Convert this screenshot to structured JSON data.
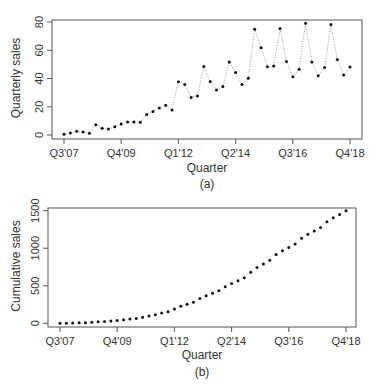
{
  "chart_data": [
    {
      "type": "line",
      "panel_label": "(a)",
      "title": "",
      "xlabel": "Quarter",
      "ylabel": "Quarterly sales",
      "ylim": [
        0,
        80
      ],
      "yticks": [
        0,
        20,
        40,
        60,
        80
      ],
      "xtick_labels": [
        "Q3'07",
        "Q4'09",
        "Q1'12",
        "Q2'14",
        "Q3'16",
        "Q4'18"
      ],
      "xtick_positions": [
        0,
        9,
        18,
        27,
        36,
        45
      ],
      "grid": false,
      "legend": null,
      "style": "points joined by dotted line",
      "x": [
        "Q3'07",
        "Q4'07",
        "Q1'08",
        "Q2'08",
        "Q3'08",
        "Q4'08",
        "Q1'09",
        "Q2'09",
        "Q3'09",
        "Q4'09",
        "Q1'10",
        "Q2'10",
        "Q3'10",
        "Q4'10",
        "Q1'11",
        "Q2'11",
        "Q3'11",
        "Q4'11",
        "Q1'12",
        "Q2'12",
        "Q3'12",
        "Q4'12",
        "Q1'13",
        "Q2'13",
        "Q3'13",
        "Q4'13",
        "Q1'14",
        "Q2'14",
        "Q3'14",
        "Q4'14",
        "Q1'15",
        "Q2'15",
        "Q3'15",
        "Q4'15",
        "Q1'16",
        "Q2'16",
        "Q3'16",
        "Q4'16",
        "Q1'17",
        "Q2'17",
        "Q3'17",
        "Q4'17",
        "Q1'18",
        "Q2'18",
        "Q3'18",
        "Q4'18"
      ],
      "series": [
        {
          "name": "Quarterly sales",
          "values": [
            0.5,
            1.4,
            2.6,
            2.1,
            1.2,
            7.3,
            4.7,
            4.2,
            5.9,
            7.8,
            9.2,
            9.2,
            9.0,
            14.6,
            16.7,
            19.1,
            21.0,
            17.7,
            37.7,
            35.8,
            26.6,
            27.6,
            48.5,
            37.9,
            31.8,
            34.4,
            51.6,
            44.3,
            35.8,
            40.1,
            74.9,
            61.7,
            48.3,
            48.8,
            75.4,
            52.1,
            41.2,
            46.6,
            79.2,
            51.6,
            41.9,
            47.8,
            78.2,
            53.5,
            42.4,
            48.1
          ]
        }
      ]
    },
    {
      "type": "scatter",
      "panel_label": "(b)",
      "title": "",
      "xlabel": "Quarter",
      "ylabel": "Cumulative sales",
      "ylim": [
        0,
        1500
      ],
      "yticks": [
        0,
        500,
        1000,
        1500
      ],
      "xtick_labels": [
        "Q3'07",
        "Q4'09",
        "Q1'12",
        "Q2'14",
        "Q3'16",
        "Q4'18"
      ],
      "xtick_positions": [
        0,
        9,
        18,
        27,
        36,
        45
      ],
      "grid": false,
      "legend": null,
      "style": "points only",
      "x": [
        "Q3'07",
        "Q4'07",
        "Q1'08",
        "Q2'08",
        "Q3'08",
        "Q4'08",
        "Q1'09",
        "Q2'09",
        "Q3'09",
        "Q4'09",
        "Q1'10",
        "Q2'10",
        "Q3'10",
        "Q4'10",
        "Q1'11",
        "Q2'11",
        "Q3'11",
        "Q4'11",
        "Q1'12",
        "Q2'12",
        "Q3'12",
        "Q4'12",
        "Q1'13",
        "Q2'13",
        "Q3'13",
        "Q4'13",
        "Q1'14",
        "Q2'14",
        "Q3'14",
        "Q4'14",
        "Q1'15",
        "Q2'15",
        "Q3'15",
        "Q4'15",
        "Q1'16",
        "Q2'16",
        "Q3'16",
        "Q4'16",
        "Q1'17",
        "Q2'17",
        "Q3'17",
        "Q4'17",
        "Q1'18",
        "Q2'18",
        "Q3'18",
        "Q4'18"
      ],
      "series": [
        {
          "name": "Cumulative sales",
          "values": [
            0.5,
            1.9,
            4.5,
            6.6,
            7.8,
            15.1,
            19.8,
            24.0,
            29.9,
            37.7,
            46.9,
            56.1,
            65.1,
            79.7,
            96.4,
            115.5,
            136.5,
            154.2,
            191.9,
            227.7,
            254.3,
            281.9,
            330.4,
            368.3,
            400.1,
            434.5,
            486.1,
            530.4,
            566.2,
            606.3,
            681.2,
            742.9,
            791.2,
            840.0,
            915.4,
            967.5,
            1008.7,
            1055.3,
            1134.5,
            1186.1,
            1228.0,
            1275.8,
            1354.0,
            1407.5,
            1449.9,
            1498.0
          ]
        }
      ]
    }
  ],
  "colors": {
    "points": "#111111",
    "connector": "#9a9a9a",
    "axis": "#555555",
    "text": "#333333"
  }
}
